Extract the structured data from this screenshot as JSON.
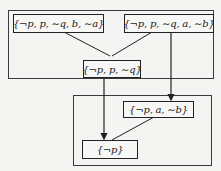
{
  "diagram": {
    "groups": [
      {
        "id": "top-group"
      },
      {
        "id": "bottom-group"
      }
    ],
    "nodes": {
      "a": {
        "label": "{¬p, p, ∼q, b, ∼a}"
      },
      "b": {
        "label": "{¬p, p, ∼q, a, ∼b}"
      },
      "c": {
        "label": "{¬p, p, ∼q}"
      },
      "d": {
        "label": "{¬p, a, ∼b}"
      },
      "e": {
        "label": "{¬p}"
      }
    },
    "edges": [
      {
        "from": "a",
        "to": "c",
        "arrow": false
      },
      {
        "from": "b",
        "to": "c",
        "arrow": false
      },
      {
        "from": "c",
        "to": "e",
        "arrow": true
      },
      {
        "from": "b",
        "to": "d",
        "arrow": true
      },
      {
        "from": "d",
        "to": "e",
        "arrow": false
      }
    ]
  }
}
